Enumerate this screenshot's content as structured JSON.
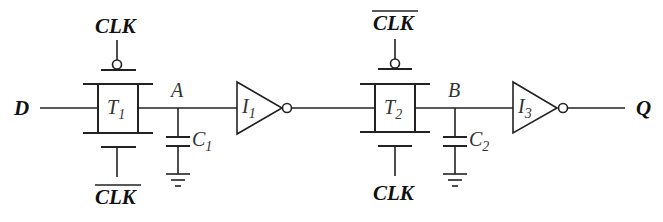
{
  "diagram": {
    "type": "circuit-schematic",
    "input": {
      "label": "D"
    },
    "output": {
      "label": "Q"
    },
    "transmission_gates": [
      {
        "name": "T",
        "sub": "1",
        "top_gate": "CLK",
        "top_gate_inverted_bar": false,
        "bottom_gate": "CLK",
        "bottom_gate_overbar": true
      },
      {
        "name": "T",
        "sub": "2",
        "top_gate": "CLK",
        "top_gate_overbar": true,
        "bottom_gate": "CLK",
        "bottom_gate_overbar": false
      }
    ],
    "nodes": [
      {
        "label": "A",
        "capacitor": {
          "name": "C",
          "sub": "1"
        }
      },
      {
        "label": "B",
        "capacitor": {
          "name": "C",
          "sub": "2"
        }
      }
    ],
    "inverters": [
      {
        "name": "I",
        "sub": "1"
      },
      {
        "name": "I",
        "sub": "3"
      }
    ],
    "connections": [
      "D -> T1",
      "T1 -> A",
      "A -> C1 -> GND",
      "A -> I1",
      "I1 -> T2",
      "T2 -> B",
      "B -> C2 -> GND",
      "B -> I3",
      "I3 -> Q"
    ]
  }
}
